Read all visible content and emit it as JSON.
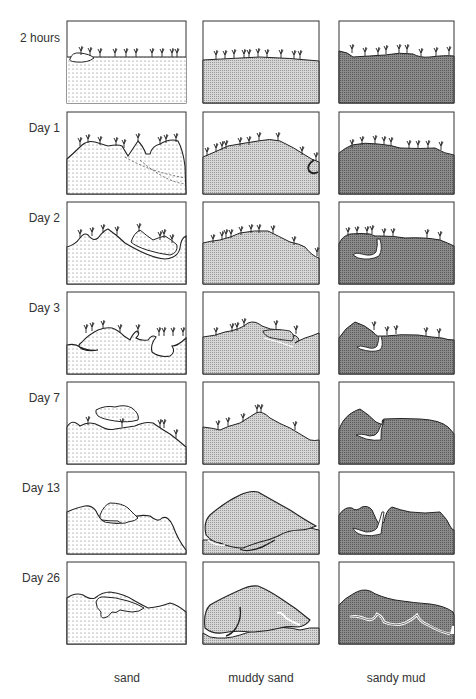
{
  "figure": {
    "row_labels": [
      "2 hours",
      "Day 1",
      "Day 2",
      "Day 3",
      "Day 7",
      "Day 13",
      "Day 26"
    ],
    "column_labels": [
      "sand",
      "muddy sand",
      "sandy mud"
    ],
    "fills": {
      "sand": "#ffffff",
      "muddy_sand": "#cfcfcf",
      "sandy_mud": "#7a7a7a",
      "outline": "#2a2a2a"
    }
  }
}
